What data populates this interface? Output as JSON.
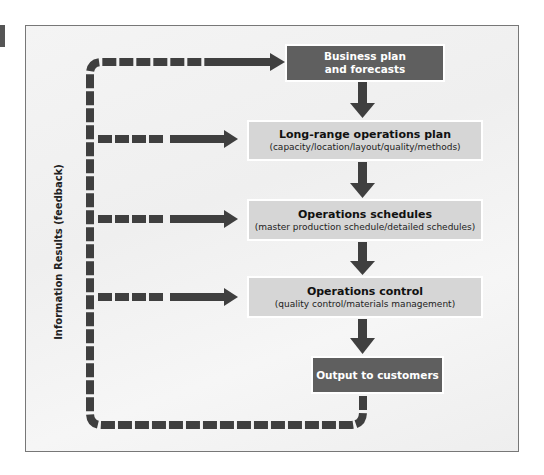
{
  "diagram": {
    "side_label": "Information Results (feedback)",
    "nodes": [
      {
        "id": "business-plan",
        "line1": "Business plan",
        "line2": "and forecasts"
      },
      {
        "id": "long-range",
        "title": "Long-range operations plan",
        "subtitle": "(capacity/location/layout/quality/methods)"
      },
      {
        "id": "schedules",
        "title": "Operations schedules",
        "subtitle": "(master production schedule/detailed schedules)"
      },
      {
        "id": "control",
        "title": "Operations control",
        "subtitle": "(quality control/materials management)"
      },
      {
        "id": "output",
        "title": "Output to customers"
      }
    ],
    "edges": [
      {
        "from": "business-plan",
        "to": "long-range",
        "style": "solid"
      },
      {
        "from": "long-range",
        "to": "schedules",
        "style": "solid"
      },
      {
        "from": "schedules",
        "to": "control",
        "style": "solid"
      },
      {
        "from": "control",
        "to": "output",
        "style": "solid"
      },
      {
        "from": "output",
        "to": "business-plan",
        "style": "dashed",
        "label": "Information Results (feedback)"
      },
      {
        "from": "output",
        "to": "long-range",
        "style": "dashed"
      },
      {
        "from": "output",
        "to": "schedules",
        "style": "dashed"
      },
      {
        "from": "output",
        "to": "control",
        "style": "dashed"
      }
    ],
    "colors": {
      "dark_box": "#5f5f5f",
      "light_box": "#d6d6d6",
      "arrow": "#3f3f3f",
      "background": "#f2f2f2"
    }
  }
}
